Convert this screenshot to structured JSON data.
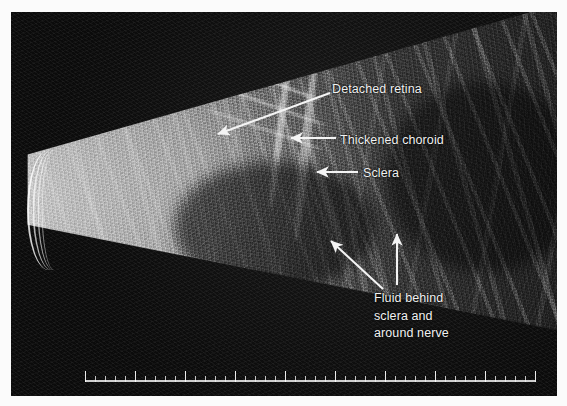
{
  "image": {
    "kind": "ocular-b-scan-ultrasound",
    "background_color": "#0c0c0c",
    "page_margin_color": "#ffffff",
    "annotation_color": "#f2f2f2"
  },
  "annotations": [
    {
      "id": "detached-retina",
      "label": "Detached retina",
      "x": 332,
      "y": 80,
      "arrow": {
        "type": "diagonal",
        "from_x": 330,
        "from_y": 93,
        "to_x": 216,
        "to_y": 134
      }
    },
    {
      "id": "thickened-choroid",
      "label": "Thickened choroid",
      "x": 340,
      "y": 131,
      "arrow": {
        "type": "horizontal-left",
        "from_x": 336,
        "from_y": 138,
        "to_x": 289,
        "to_y": 138
      }
    },
    {
      "id": "sclera",
      "label": "Sclera",
      "x": 363,
      "y": 164,
      "arrow": {
        "type": "horizontal-left",
        "from_x": 358,
        "from_y": 172,
        "to_x": 316,
        "to_y": 172
      }
    },
    {
      "id": "fluid-behind-sclera",
      "label": "Fluid behind\nsclera and\naround nerve",
      "lines": [
        "Fluid behind",
        "sclera and",
        "around nerve"
      ],
      "x": 374,
      "y": 289,
      "arrows": [
        {
          "type": "diagonal",
          "from_x": 383,
          "from_y": 289,
          "to_x": 329,
          "to_y": 240
        },
        {
          "type": "vertical-up",
          "from_x": 397,
          "from_y": 285,
          "to_x": 397,
          "to_y": 232
        }
      ]
    }
  ],
  "scale_bar": {
    "name": "depth-ruler",
    "total_ticks": 46,
    "major_every": 5,
    "orientation": "horizontal-bottom"
  },
  "probe": {
    "name": "transducer-face",
    "arc_count": 4,
    "position": "left-apex"
  }
}
